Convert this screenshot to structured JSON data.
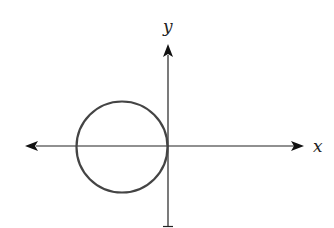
{
  "diagram": {
    "type": "coordinate-plane",
    "x_axis": {
      "label": "x",
      "y": 146,
      "x_start": 25,
      "x_end": 304
    },
    "y_axis": {
      "label": "y",
      "x": 168,
      "y_start": 44,
      "y_end": 227
    },
    "circle": {
      "cx": 122,
      "cy": 147,
      "r": 46,
      "stroke": "#444444",
      "stroke_width": 2.2,
      "description": "circle in the left half-plane tangent to the y-axis at the origin"
    },
    "colors": {
      "axis": "#222222",
      "circle": "#444444",
      "background": "#ffffff"
    }
  }
}
